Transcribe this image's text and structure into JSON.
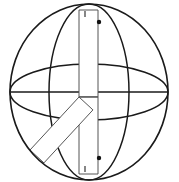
{
  "figure": {
    "title": "Sphere with orthogonal great circles and Y-shaped internal band",
    "type": "line-drawing",
    "background_color": "#ffffff",
    "stroke_color": "#1a1a1a",
    "band_stroke_color": "#555555",
    "marker_color": "#111111",
    "canvas": {
      "width": 179,
      "height": 182
    },
    "sphere": {
      "name": "outer-circle",
      "center_x": 89,
      "center_y": 92,
      "radius_x": 79,
      "radius_y": 88,
      "stroke_width": 1.6
    },
    "vertical_great_circle": {
      "name": "vertical-ellipse",
      "center_x": 89,
      "center_y": 92,
      "radius_x": 40,
      "radius_y": 88,
      "stroke_width": 1.5
    },
    "horizontal_great_circle": {
      "name": "horizontal-ellipse",
      "center_x": 89,
      "center_y": 92,
      "radius_x": 79,
      "radius_y": 28,
      "stroke_width": 1.5
    },
    "equator_line": {
      "name": "equator-chord",
      "x1": 11,
      "y1": 92,
      "x2": 168,
      "y2": 92,
      "stroke_width": 1.4
    },
    "band": {
      "name": "y-shaped-band",
      "hub_x": 89,
      "hub_y": 97,
      "thickness": 19,
      "arms": [
        {
          "label": "upper-arm",
          "direction": "up",
          "end_y": 10
        },
        {
          "label": "lower-arm",
          "direction": "down",
          "end_y": 174
        },
        {
          "label": "diagonal-arm",
          "direction": "down-left",
          "end_x": 30,
          "end_y": 150
        }
      ]
    },
    "markers": [
      {
        "label": "upper-rivet",
        "cx": 99,
        "cy": 22,
        "r": 2.2
      },
      {
        "label": "lower-rivet",
        "cx": 99,
        "cy": 158,
        "r": 2.2
      }
    ],
    "ticks": [
      {
        "label": "upper-tick",
        "x": 85,
        "y1": 11,
        "y2": 17
      },
      {
        "label": "lower-tick",
        "x": 85,
        "y1": 166,
        "y2": 172
      }
    ]
  }
}
